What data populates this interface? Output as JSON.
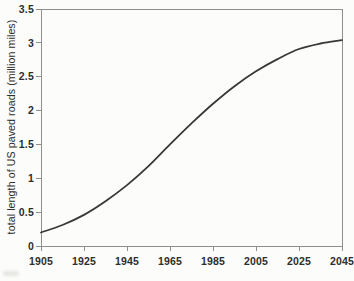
{
  "chart_data": {
    "type": "line",
    "title": "",
    "xlabel": "",
    "ylabel": "total length of US paved roads (million miles)",
    "x_ticks": [
      "1905",
      "1925",
      "1945",
      "1965",
      "1985",
      "2005",
      "2025",
      "2045"
    ],
    "y_ticks": [
      "3.5",
      "3",
      "2.5",
      "2",
      "1.5",
      "1",
      "0.5",
      "0"
    ],
    "xlim": [
      1905,
      2045
    ],
    "ylim": [
      0,
      3.5
    ],
    "grid": false,
    "legend": "none",
    "series": [
      {
        "name": "total length of US paved roads",
        "x": [
          1905,
          1915,
          1925,
          1935,
          1945,
          1955,
          1965,
          1975,
          1985,
          1995,
          2005,
          2015,
          2025,
          2035,
          2045
        ],
        "values": [
          0.2,
          0.31,
          0.46,
          0.66,
          0.9,
          1.18,
          1.5,
          1.81,
          2.1,
          2.36,
          2.58,
          2.76,
          2.91,
          2.99,
          3.04
        ],
        "color": "#383838"
      }
    ]
  },
  "colors": {
    "curve": "#383838",
    "axis": "#8f8f8f",
    "text": "#2e2e2e",
    "background": "#fcfcfa"
  }
}
